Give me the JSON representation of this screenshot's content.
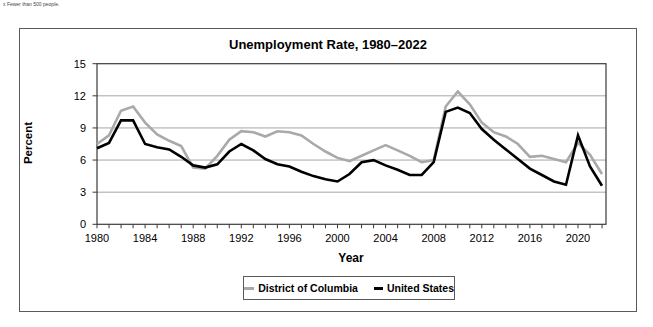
{
  "footnote": "x Fewer than 500 people.",
  "chart_data": {
    "type": "line",
    "title": "Unemployment Rate, 1980–2022",
    "xlabel": "Year",
    "ylabel": "Percent",
    "ylim": [
      0,
      15
    ],
    "yticks": [
      0,
      3,
      6,
      9,
      12,
      15
    ],
    "xticks": [
      1980,
      1984,
      1988,
      1992,
      1996,
      2000,
      2004,
      2008,
      2012,
      2016,
      2020
    ],
    "grid": "horizontal",
    "legend_position": "bottom-center",
    "x": [
      1980,
      1981,
      1982,
      1983,
      1984,
      1985,
      1986,
      1987,
      1988,
      1989,
      1990,
      1991,
      1992,
      1993,
      1994,
      1995,
      1996,
      1997,
      1998,
      1999,
      2000,
      2001,
      2002,
      2003,
      2004,
      2005,
      2006,
      2007,
      2008,
      2009,
      2010,
      2011,
      2012,
      2013,
      2014,
      2015,
      2016,
      2017,
      2018,
      2019,
      2020,
      2021,
      2022
    ],
    "series": [
      {
        "name": "District of Columbia",
        "color": "#a9a9a9",
        "values": [
          7.5,
          8.3,
          10.6,
          11.0,
          9.5,
          8.4,
          7.8,
          7.3,
          5.3,
          5.2,
          6.4,
          7.9,
          8.7,
          8.6,
          8.2,
          8.7,
          8.6,
          8.3,
          7.5,
          6.8,
          6.2,
          5.9,
          6.4,
          6.9,
          7.4,
          6.9,
          6.4,
          5.8,
          6.0,
          11.0,
          12.4,
          11.2,
          9.5,
          8.6,
          8.2,
          7.5,
          6.3,
          6.4,
          6.1,
          5.8,
          7.6,
          6.5,
          4.7
        ]
      },
      {
        "name": "United States",
        "color": "#000000",
        "values": [
          7.1,
          7.6,
          9.7,
          9.7,
          7.5,
          7.2,
          7.0,
          6.3,
          5.5,
          5.3,
          5.6,
          6.8,
          7.5,
          6.9,
          6.1,
          5.6,
          5.4,
          4.9,
          4.5,
          4.2,
          4.0,
          4.7,
          5.8,
          6.0,
          5.5,
          5.1,
          4.6,
          4.6,
          5.8,
          10.5,
          10.9,
          10.4,
          8.9,
          7.9,
          7.0,
          6.1,
          5.2,
          4.6,
          4.0,
          3.7,
          8.3,
          5.4,
          3.6
        ]
      }
    ]
  },
  "legend": {
    "dc_label": "District of Columbia",
    "us_label": "United States"
  },
  "colors": {
    "dc_line": "#a9a9a9",
    "us_line": "#000000",
    "gridline": "#8f8f8f",
    "axis": "#3a3a3a",
    "frame": "#5a5a5a"
  }
}
